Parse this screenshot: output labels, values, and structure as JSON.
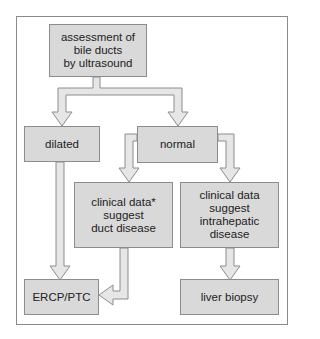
{
  "colors": {
    "box_fill": "#d9d9d9",
    "box_border": "#8c8c8c",
    "arrow_fill": "#e6e6e6",
    "arrow_stroke": "#8c8c8c",
    "frame": "#8a8a8a"
  },
  "nodes": {
    "assessment": "assessment of\nbile ducts\nby ultrasound",
    "dilated": "dilated",
    "normal": "normal",
    "clinical_duct": "clinical data*\nsuggest\nduct disease",
    "clinical_intrahepatic": "clinical data\nsuggest\nintrahepatic\ndisease",
    "ercp": "ERCP/PTC",
    "liver_biopsy": "liver biopsy"
  },
  "edges": [
    {
      "from": "assessment",
      "to": "dilated"
    },
    {
      "from": "assessment",
      "to": "normal"
    },
    {
      "from": "normal",
      "to": "clinical_duct"
    },
    {
      "from": "normal",
      "to": "clinical_intrahepatic"
    },
    {
      "from": "dilated",
      "to": "ercp"
    },
    {
      "from": "clinical_duct",
      "to": "ercp"
    },
    {
      "from": "clinical_intrahepatic",
      "to": "liver_biopsy"
    }
  ]
}
